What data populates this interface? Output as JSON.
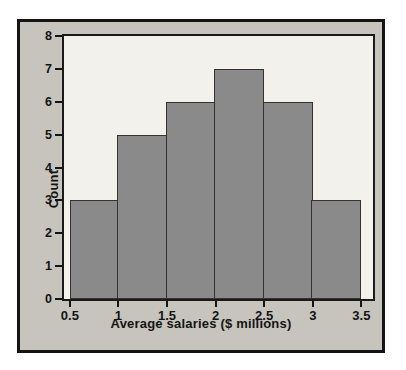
{
  "figure": {
    "outer_background": "#ffffff",
    "frame_background": "#c7c4bd",
    "frame_border_color": "#141414",
    "plot_background": "#f2f1ec",
    "plot_border_color": "#1a1a1a"
  },
  "chart_data": {
    "type": "bar",
    "chart_kind": "histogram",
    "title": "",
    "xlabel": "Average salaries ($ millions)",
    "ylabel": "Count",
    "bin_edges": [
      0.5,
      1.0,
      1.5,
      2.0,
      2.5,
      3.0,
      3.5
    ],
    "values": [
      3,
      5,
      6,
      7,
      6,
      3
    ],
    "x_tick_values": [
      0.5,
      1.0,
      1.5,
      2.0,
      2.5,
      3.0,
      3.5
    ],
    "x_tick_labels": [
      "0.5",
      "1",
      "1.5",
      "2",
      "2.5",
      "3",
      "3.5"
    ],
    "y_tick_values": [
      0,
      1,
      2,
      3,
      4,
      5,
      6,
      7,
      8
    ],
    "y_tick_labels": [
      "0",
      "1",
      "2",
      "3",
      "4",
      "5",
      "6",
      "7",
      "8"
    ],
    "xlim": [
      0.44,
      3.62
    ],
    "ylim": [
      0,
      8
    ],
    "grid": false,
    "legend": null,
    "bar_fill": "#8a8a8a",
    "bar_border": "#333333"
  }
}
